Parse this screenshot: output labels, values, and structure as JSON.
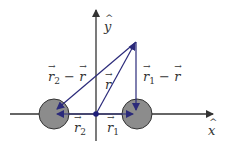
{
  "diagram": {
    "type": "vector-diagram",
    "colors": {
      "axis": "#333333",
      "vector": "#2b2a7a",
      "sphere_fill": "#8c8c8c",
      "sphere_stroke": "#333333",
      "origin_dot": "#1f1f7a"
    },
    "axes": {
      "x_label": "x",
      "y_label": "y"
    },
    "labels": {
      "r": "r",
      "r1": "r",
      "r1_sub": "1",
      "r2": "r",
      "r2_sub": "2",
      "r1_minus_r": "r",
      "r1_minus_r_sub": "1",
      "r1_minus_r_op": " − ",
      "r1_minus_r_tail": "r",
      "r2_minus_r": "r",
      "r2_minus_r_sub": "2",
      "r2_minus_r_op": " − ",
      "r2_minus_r_tail": "r"
    }
  }
}
